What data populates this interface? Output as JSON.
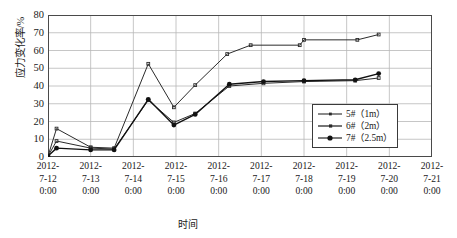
{
  "chart_data": {
    "type": "line",
    "title": "",
    "xlabel": "时间",
    "ylabel": "应力变化率/%",
    "ylim": [
      0,
      80
    ],
    "yticks": [
      0,
      10,
      20,
      30,
      40,
      50,
      60,
      70,
      80
    ],
    "grid": true,
    "legend_position": "right-middle",
    "x_categories": [
      "2012-7-12 0:00",
      "2012-7-13 0:00",
      "2012-7-14 0:00",
      "2012-7-15 0:00",
      "2012-7-16 0:00",
      "2012-7-17 0:00",
      "2012-7-18 0:00",
      "2012-7-19 0:00",
      "2012-7-20 0:00",
      "2012-7-21 0:00"
    ],
    "xtick_lines": [
      [
        "2012-",
        "7-12",
        "0:00"
      ],
      [
        "2012-",
        "7-13",
        "0:00"
      ],
      [
        "2012-",
        "7-14",
        "0:00"
      ],
      [
        "2012-",
        "7-15",
        "0:00"
      ],
      [
        "2012-",
        "7-16",
        "0:00"
      ],
      [
        "2012-",
        "7-17",
        "0:00"
      ],
      [
        "2012-",
        "7-18",
        "0:00"
      ],
      [
        "2012-",
        "7-19",
        "0:00"
      ],
      [
        "2012-",
        "7-20",
        "0:00"
      ],
      [
        "2012-",
        "7-21",
        "0:00"
      ]
    ],
    "series": [
      {
        "name": "5#（1m）",
        "color": "#2b2b2b",
        "marker": "none",
        "points": [
          {
            "x": 1.0,
            "y": 0.5
          },
          {
            "x": 1.2,
            "y": 16.0
          },
          {
            "x": 2.0,
            "y": 5.5
          },
          {
            "x": 2.55,
            "y": 5.0
          },
          {
            "x": 3.35,
            "y": 52.5
          },
          {
            "x": 3.95,
            "y": 28.0
          },
          {
            "x": 4.45,
            "y": 40.5
          },
          {
            "x": 5.2,
            "y": 58.0
          },
          {
            "x": 5.75,
            "y": 63.0
          },
          {
            "x": 6.9,
            "y": 63.0
          },
          {
            "x": 7.0,
            "y": 66.0
          },
          {
            "x": 8.25,
            "y": 66.0
          },
          {
            "x": 8.75,
            "y": 69.0
          }
        ]
      },
      {
        "name": "6#（2m）",
        "color": "#2b2b2b",
        "marker": "none",
        "points": [
          {
            "x": 1.0,
            "y": 0.5
          },
          {
            "x": 1.2,
            "y": 9.0
          },
          {
            "x": 2.0,
            "y": 5.0
          },
          {
            "x": 2.55,
            "y": 4.5
          },
          {
            "x": 3.35,
            "y": 32.0
          },
          {
            "x": 3.95,
            "y": 19.5
          },
          {
            "x": 4.45,
            "y": 24.5
          },
          {
            "x": 5.25,
            "y": 40.0
          },
          {
            "x": 6.05,
            "y": 41.5
          },
          {
            "x": 7.0,
            "y": 42.5
          },
          {
            "x": 8.2,
            "y": 43.0
          },
          {
            "x": 8.75,
            "y": 44.5
          }
        ]
      },
      {
        "name": "7#（2.5m）",
        "color": "#111111",
        "marker": "filled-circle",
        "points": [
          {
            "x": 1.0,
            "y": 0.5
          },
          {
            "x": 1.2,
            "y": 5.0
          },
          {
            "x": 2.0,
            "y": 4.0
          },
          {
            "x": 2.55,
            "y": 4.0
          },
          {
            "x": 3.35,
            "y": 32.5
          },
          {
            "x": 3.95,
            "y": 18.0
          },
          {
            "x": 4.45,
            "y": 24.0
          },
          {
            "x": 5.25,
            "y": 41.0
          },
          {
            "x": 6.05,
            "y": 42.5
          },
          {
            "x": 7.0,
            "y": 43.0
          },
          {
            "x": 8.2,
            "y": 43.5
          },
          {
            "x": 8.75,
            "y": 47.0
          }
        ]
      }
    ],
    "colors": {
      "grid": "#b8b8b8",
      "axis": "#4a4a4a",
      "line": "#2b2b2b",
      "background": "#ffffff"
    }
  },
  "legend": {
    "items": [
      {
        "label": "5#（1m）"
      },
      {
        "label": "6#（2m）"
      },
      {
        "label": "7#（2.5m）"
      }
    ]
  }
}
